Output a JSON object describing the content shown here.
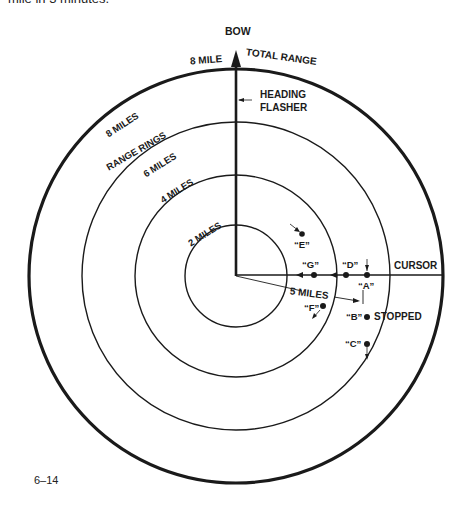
{
  "top_text": "mile in 3 minutes.",
  "figure_number": "6–14",
  "labels": {
    "bow": "BOW",
    "eight_mile": "8 MILE",
    "total_range": "TOTAL RANGE",
    "heading_flasher_1": "HEADING",
    "heading_flasher_2": "FLASHER",
    "eight_miles": "8 MILES",
    "range_rings": "RANGE RINGS",
    "six_miles": "6 MILES",
    "four_miles": "4 MILES",
    "two_miles": "2 MILES",
    "cursor": "CURSOR",
    "five_miles": "5 MILES",
    "stopped": "STOPPED"
  },
  "targets": [
    {
      "id": "A",
      "label": "“A”"
    },
    {
      "id": "B",
      "label": "“B”"
    },
    {
      "id": "C",
      "label": "“C”"
    },
    {
      "id": "D",
      "label": "“D”"
    },
    {
      "id": "E",
      "label": "“E”"
    },
    {
      "id": "F",
      "label": "“F”"
    },
    {
      "id": "G",
      "label": "“G”"
    }
  ],
  "rings_miles": [
    2,
    4,
    6,
    8
  ],
  "colors": {
    "ink": "#1a1a1a",
    "background": "#ffffff"
  }
}
